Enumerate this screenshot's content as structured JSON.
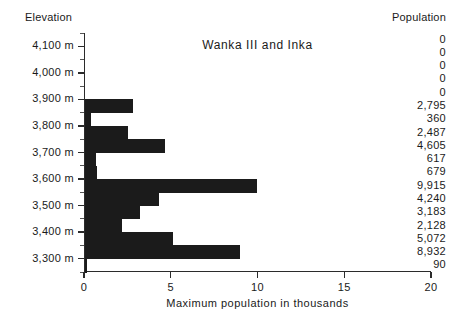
{
  "headers": {
    "elevation": "Elevation",
    "population": "Population"
  },
  "chart_data": {
    "type": "bar",
    "orientation": "horizontal",
    "title": "Wanka III and Inka",
    "xlabel": "Maximum population in thousands",
    "ylabel": "Elevation",
    "xlim": [
      0,
      20
    ],
    "xticks": [
      0,
      5,
      10,
      15,
      20
    ],
    "xtick_labels": [
      "0",
      "5",
      "10",
      "15",
      "20"
    ],
    "ytick_labels": [
      "4,100 m",
      "4,000 m",
      "3,900 m",
      "3,800 m",
      "3,700 m",
      "3,600 m",
      "3,500 m",
      "3,400 m",
      "3,300 m"
    ],
    "yticks": [
      4100,
      4000,
      3900,
      3800,
      3700,
      3600,
      3500,
      3400,
      3300
    ],
    "grid": false,
    "legend": null,
    "bar_color": "#1b1b1b",
    "units": "thousands",
    "categories": [
      "4,150 m",
      "4,100 m",
      "4,050 m",
      "4,000 m",
      "3,950 m",
      "3,900 m",
      "3,850 m",
      "3,800 m",
      "3,750 m",
      "3,700 m",
      "3,650 m",
      "3,600 m",
      "3,550 m",
      "3,500 m",
      "3,450 m"
    ],
    "values": [
      0,
      0,
      0,
      0,
      0,
      2795,
      360,
      2487,
      4605,
      617,
      679,
      9915,
      4240,
      3183,
      2128
    ],
    "value_labels": [
      "0",
      "0",
      "0",
      "0",
      "0",
      "2,795",
      "360",
      "2,487",
      "4,605",
      "617",
      "679",
      "9,915",
      "4,240",
      "3,183",
      "2,128"
    ]
  },
  "population_column": [
    "0",
    "0",
    "0",
    "0",
    "0",
    "2,795",
    "360",
    "2,487",
    "4,605",
    "617",
    "679",
    "9,915",
    "4,240",
    "3,183",
    "2,128",
    "5,072",
    "8,932",
    "90"
  ],
  "rows": [
    {
      "label": "0",
      "value": 0
    },
    {
      "label": "0",
      "value": 0
    },
    {
      "label": "0",
      "value": 0
    },
    {
      "label": "0",
      "value": 0
    },
    {
      "label": "0",
      "value": 0
    },
    {
      "label": "2,795",
      "value": 2795
    },
    {
      "label": "360",
      "value": 360
    },
    {
      "label": "2,487",
      "value": 2487
    },
    {
      "label": "4,605",
      "value": 4605
    },
    {
      "label": "617",
      "value": 617
    },
    {
      "label": "679",
      "value": 679
    },
    {
      "label": "9,915",
      "value": 9915
    },
    {
      "label": "4,240",
      "value": 4240
    },
    {
      "label": "3,183",
      "value": 3183
    },
    {
      "label": "2,128",
      "value": 2128
    },
    {
      "label": "5,072",
      "value": 5072
    },
    {
      "label": "8,932",
      "value": 8932
    },
    {
      "label": "90",
      "value": 90
    }
  ],
  "y_labels": [
    "4,100 m",
    "4,000 m",
    "3,900 m",
    "3,800 m",
    "3,700 m",
    "3,600 m",
    "3,500 m",
    "3,400 m",
    "3,300 m"
  ],
  "x_labels": [
    "0",
    "5",
    "10",
    "15",
    "20"
  ],
  "x_axis_title": "Maximum population in thousands"
}
